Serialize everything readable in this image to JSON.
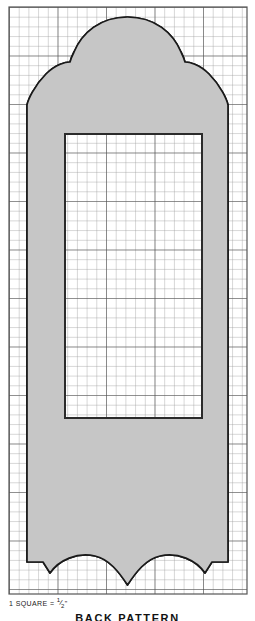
{
  "drawing": {
    "title": "BACK PATTERN",
    "scale_note_prefix": "1 SQUARE =",
    "scale_note_numerator": "1",
    "scale_note_denominator": "2",
    "scale_note_unit": "\"",
    "grid": {
      "left": 9,
      "top": 7,
      "right": 247,
      "bottom": 594,
      "cell": 9.7,
      "line_color": "#4a4a4a",
      "minor_line_color": "#8a8a8a",
      "background": "#ffffff"
    },
    "shape": {
      "name": "chair-back-silhouette",
      "fill": "#c6c6c6",
      "stroke": "#1a1a1a",
      "stroke_width": 1.6
    },
    "inner_panel": {
      "name": "inset-panel",
      "x": 65,
      "y": 134,
      "width": 137,
      "height": 284,
      "fill": "#ffffff",
      "stroke": "#2b2b2b",
      "stroke_width": 2
    },
    "outer_frame": {
      "stroke": "#555555",
      "stroke_width": 1
    }
  }
}
